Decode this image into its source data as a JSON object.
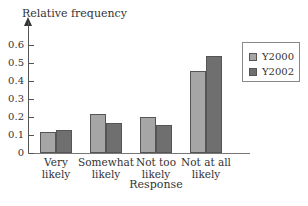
{
  "chart_data": {
    "type": "bar",
    "title": "",
    "xlabel": "Response",
    "ylabel": "Relative frequency",
    "categories": [
      "Very likely",
      "Somewhat likely",
      "Not too likely",
      "Not at all likely"
    ],
    "category_lines": [
      [
        "Very",
        "likely"
      ],
      [
        "Somewhat",
        "likely"
      ],
      [
        "Not too",
        "likely"
      ],
      [
        "Not at all",
        "likely"
      ]
    ],
    "series": [
      {
        "name": "Y2000",
        "color": "#a6a6a6",
        "values": [
          0.12,
          0.22,
          0.2,
          0.46
        ]
      },
      {
        "name": "Y2002",
        "color": "#6f6f6f",
        "values": [
          0.13,
          0.17,
          0.16,
          0.54
        ]
      }
    ],
    "ylim": [
      0,
      0.6
    ],
    "yticks": [
      "0",
      "0.1",
      "0.2",
      "0.3",
      "0.4",
      "0.5",
      "0.6"
    ],
    "grid": false,
    "legend_position": "upper right"
  }
}
